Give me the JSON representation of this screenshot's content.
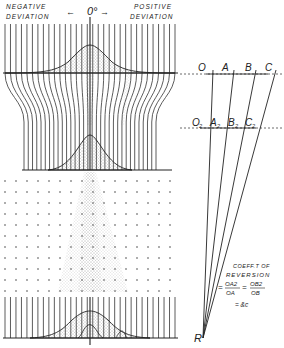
{
  "header": {
    "negative_line1": "NEGATIVE",
    "negative_line2": "DEVIATION",
    "positive_line1": "POSITIVE",
    "positive_line2": "DEVIATION",
    "zero_label": "0°",
    "left_arrow": "←",
    "right_arrow": "→"
  },
  "construction": {
    "top_points": [
      "O",
      "A",
      "B",
      "C"
    ],
    "lower_points": [
      "O2",
      "A2",
      "B2",
      "C2"
    ],
    "lower_point_letters": [
      "O",
      "A",
      "B",
      "C"
    ],
    "subscript": "2",
    "apex": "R"
  },
  "formula": {
    "line1": "COEFF.T OF",
    "line2": "REVERSION",
    "eq1": "=",
    "num1": "OA2",
    "den1": "OA",
    "eq2": "=",
    "num2": "OB2",
    "den2": "OB",
    "eq3": "= &c"
  },
  "colors": {
    "ink": "#222222",
    "stipple": "#555555",
    "background": "#ffffff"
  }
}
